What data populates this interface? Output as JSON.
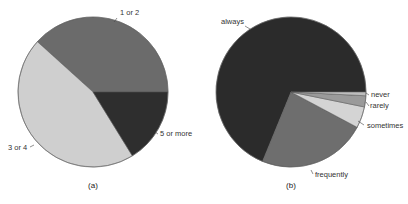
{
  "chart_data": [
    {
      "type": "pie",
      "title": "",
      "caption": "(a)",
      "start_angle_deg": 0,
      "direction": "counterclockwise",
      "categories": [
        "1 or 2",
        "3 or 4",
        "5 or more"
      ],
      "values": [
        38.3,
        45.5,
        16.2
      ],
      "colors": [
        "#6b6b6b",
        "#cfcfcf",
        "#2e2e2e"
      ],
      "center": [
        93,
        92
      ],
      "radius": 75,
      "label_positions": [
        [
          120,
          15
        ],
        [
          8,
          150
        ],
        [
          160,
          136
        ]
      ],
      "leader_lines": [
        [
          [
            117,
            18
          ],
          [
            114,
            22
          ]
        ],
        [
          [
            30,
            147
          ],
          [
            34,
            145
          ]
        ],
        [
          [
            155,
            132
          ],
          [
            158,
            134
          ]
        ]
      ]
    },
    {
      "type": "pie",
      "title": "",
      "caption": "(b)",
      "start_angle_deg": 0,
      "direction": "counterclockwise",
      "categories": [
        "always",
        "frequently",
        "sometimes",
        "rarely",
        "never"
      ],
      "values": [
        68.8,
        23.4,
        4.6,
        2.4,
        0.8
      ],
      "colors": [
        "#2b2b2b",
        "#6e6e6e",
        "#d4d4d4",
        "#9a9a9a",
        "#bdbdbd"
      ],
      "center": [
        291,
        92
      ],
      "radius": 75,
      "label_positions": [
        [
          221,
          24
        ],
        [
          315,
          177
        ],
        [
          367,
          128
        ],
        [
          370,
          108
        ],
        [
          371,
          97
        ]
      ],
      "leader_lines": [
        [
          [
            245,
            26
          ],
          [
            250,
            29
          ]
        ],
        [
          [
            311,
            170
          ],
          [
            313,
            174
          ]
        ],
        [
          [
            358,
            121
          ],
          [
            364,
            125
          ]
        ],
        [
          [
            366,
            102
          ],
          [
            369,
            106
          ]
        ],
        [
          [
            366,
            93
          ],
          [
            369,
            95
          ]
        ]
      ]
    }
  ]
}
